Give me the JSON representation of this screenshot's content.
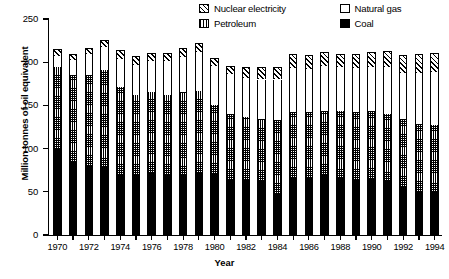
{
  "chart_data": {
    "type": "bar",
    "stacked": true,
    "title": "",
    "xlabel": "Year",
    "ylabel": "Million tonnes of oil equivalent",
    "ylim": [
      0,
      250
    ],
    "yticks": [
      0,
      50,
      100,
      150,
      200,
      250
    ],
    "grid": false,
    "legend_position": "top-right",
    "categories": [
      "1970",
      "1971",
      "1972",
      "1973",
      "1974",
      "1975",
      "1976",
      "1977",
      "1978",
      "1979",
      "1980",
      "1981",
      "1982",
      "1983",
      "1984",
      "1985",
      "1986",
      "1987",
      "1988",
      "1989",
      "1990",
      "1991",
      "1992",
      "1993",
      "1994"
    ],
    "xtick_labels": [
      "1970",
      "1972",
      "1974",
      "1976",
      "1978",
      "1980",
      "1982",
      "1984",
      "1986",
      "1988",
      "1990",
      "1992",
      "1994"
    ],
    "series": [
      {
        "name": "Coal",
        "pattern": "solid-black",
        "values": [
          100,
          85,
          80,
          79,
          70,
          70,
          72,
          69,
          70,
          72,
          71,
          64,
          64,
          63,
          48,
          66,
          66,
          69,
          66,
          64,
          65,
          62,
          56,
          50,
          50
        ]
      },
      {
        "name": "Petroleum",
        "pattern": "cross-dot",
        "values": [
          95,
          100,
          105,
          112,
          101,
          92,
          93,
          93,
          95,
          95,
          80,
          76,
          73,
          71,
          85,
          76,
          76,
          74,
          78,
          78,
          79,
          78,
          78,
          78,
          77
        ]
      },
      {
        "name": "Natural gas",
        "pattern": "white",
        "values": [
          12,
          17,
          24,
          27,
          33,
          35,
          36,
          39,
          41,
          45,
          45,
          46,
          45,
          46,
          47,
          51,
          50,
          53,
          50,
          51,
          51,
          54,
          54,
          60,
          62
        ]
      },
      {
        "name": "Nuclear electricity",
        "pattern": "diagonal-hatch",
        "values": [
          8,
          8,
          8,
          8,
          10,
          10,
          10,
          10,
          10,
          10,
          9,
          10,
          12,
          14,
          14,
          16,
          16,
          16,
          16,
          17,
          17,
          19,
          20,
          22,
          22
        ]
      }
    ],
    "totals": [
      215,
      210,
      217,
      226,
      214,
      207,
      211,
      211,
      216,
      222,
      205,
      196,
      194,
      194,
      194,
      209,
      208,
      212,
      210,
      210,
      212,
      213,
      208,
      210,
      211
    ]
  },
  "legend": {
    "entries": [
      {
        "label": "Nuclear electricity",
        "swatch": "diagonal-hatch-swatch"
      },
      {
        "label": "Natural gas",
        "swatch": "white-swatch"
      },
      {
        "label": "Petroleum",
        "swatch": "vertical-line-swatch"
      },
      {
        "label": "Coal",
        "swatch": "solid-black-swatch"
      }
    ]
  }
}
